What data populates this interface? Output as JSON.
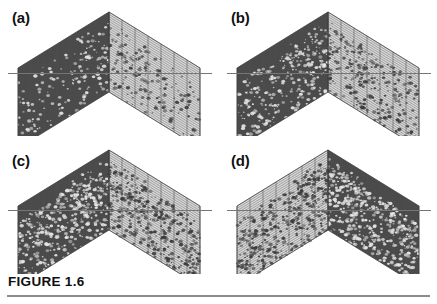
{
  "figure": {
    "caption_label": "FIGURE 1.6",
    "rule_color": "#8c8c8c",
    "background": "#ffffff"
  },
  "colors": {
    "dark_face": "#4a4a4a",
    "light_face": "#d8d8d8",
    "mesh_line": "#555555",
    "reference_line": "#767676",
    "speckle_light": "#e8e8e8",
    "speckle_dark": "#3a3a3a",
    "label_text": "#111111"
  },
  "panels": [
    {
      "id": "a",
      "label": "(a)",
      "dark_side": "left",
      "speckle_density": 0.3,
      "reference_line": true,
      "description": "V-shaped tent wireframe surface, dark speckled left face, light right face"
    },
    {
      "id": "b",
      "label": "(b)",
      "dark_side": "left",
      "speckle_density": 0.55,
      "reference_line": true,
      "description": "V-shaped tent wireframe surface, dark speckled left face, light right face, heavier noise"
    },
    {
      "id": "c",
      "label": "(c)",
      "dark_side": "left",
      "speckle_density": 0.78,
      "reference_line": true,
      "description": "V-shaped tent wireframe surface, dark speckled left face, light right face, dense noise"
    },
    {
      "id": "d",
      "label": "(d)",
      "dark_side": "right",
      "speckle_density": 0.88,
      "reference_line": true,
      "description": "V-shaped tent wireframe surface mirrored, dark speckled right face, light left face, dense noise"
    }
  ]
}
